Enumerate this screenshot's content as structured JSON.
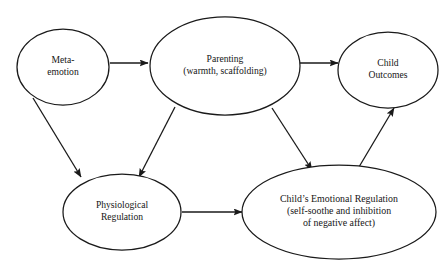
{
  "diagram": {
    "background_color": "#ffffff",
    "stroke_color": "#1a1a1a",
    "text_color": "#161616",
    "nodes": [
      {
        "id": "meta-emotion",
        "lines": [
          "Meta-",
          "emotion"
        ],
        "cx": 63,
        "cy": 67,
        "rx": 46,
        "ry": 38
      },
      {
        "id": "parenting",
        "lines": [
          "Parenting",
          "(warmth, scaffolding)"
        ],
        "cx": 225,
        "cy": 66,
        "rx": 75,
        "ry": 49
      },
      {
        "id": "child-outcomes",
        "lines": [
          "Child",
          "Outcomes"
        ],
        "cx": 388,
        "cy": 70,
        "rx": 50,
        "ry": 38
      },
      {
        "id": "physiological-regulation",
        "lines": [
          "Physiological",
          "Regulation"
        ],
        "cx": 122,
        "cy": 212,
        "rx": 59,
        "ry": 38
      },
      {
        "id": "childs-emotional-regulation",
        "lines": [
          "Child’s Emotional Regulation",
          "(self-soothe and inhibition",
          "of negative affect)"
        ],
        "cx": 339,
        "cy": 212,
        "rx": 97,
        "ry": 47
      }
    ],
    "edges": [
      {
        "id": "meta-emotion-to-parenting",
        "from": "meta-emotion",
        "to": "parenting",
        "x1": 110,
        "y1": 63,
        "x2": 148,
        "y2": 63
      },
      {
        "id": "parenting-to-child-outcomes",
        "from": "parenting",
        "to": "child-outcomes",
        "x1": 300,
        "y1": 63,
        "x2": 338,
        "y2": 63
      },
      {
        "id": "meta-emotion-to-physiological-regulation",
        "from": "meta-emotion",
        "to": "physiological-regulation",
        "x1": 33,
        "y1": 98,
        "x2": 81,
        "y2": 177
      },
      {
        "id": "parenting-to-physiological-regulation",
        "from": "parenting",
        "to": "physiological-regulation",
        "x1": 175,
        "y1": 107,
        "x2": 139,
        "y2": 177
      },
      {
        "id": "parenting-to-childs-emotional-regulation",
        "from": "parenting",
        "to": "childs-emotional-regulation",
        "x1": 272,
        "y1": 108,
        "x2": 312,
        "y2": 170
      },
      {
        "id": "physiological-regulation-to-childs-emotional-regulation",
        "from": "physiological-regulation",
        "to": "childs-emotional-regulation",
        "x1": 182,
        "y1": 212,
        "x2": 242,
        "y2": 212
      },
      {
        "id": "childs-emotional-regulation-to-child-outcomes",
        "from": "childs-emotional-regulation",
        "to": "child-outcomes",
        "x1": 356,
        "y1": 172,
        "x2": 394,
        "y2": 108
      }
    ]
  }
}
